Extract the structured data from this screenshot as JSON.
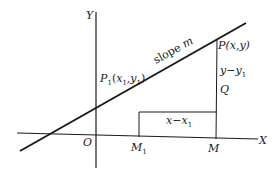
{
  "diagram": {
    "axes": {
      "x_label": "X",
      "y_label": "Y",
      "origin_label": "O"
    },
    "line_label": {
      "text": "slope ",
      "var": "m"
    },
    "points": {
      "p1": {
        "name": "P",
        "sub": "1",
        "open": "(",
        "x": "x",
        "xsub": "1",
        "comma": ",",
        "y": "y",
        "ysub": "1",
        "close": ")"
      },
      "p": {
        "text": "P(x,y)"
      },
      "q": {
        "text": "Q"
      },
      "m1": {
        "name": "M",
        "sub": "1"
      },
      "m": {
        "text": "M"
      }
    },
    "segments": {
      "run": {
        "a": "x",
        "op": "−",
        "b": "x",
        "bsub": "1"
      },
      "rise": {
        "a": "y",
        "op": "−",
        "b": "y",
        "bsub": "1"
      }
    },
    "colors": {
      "ink": "#1a1a1a",
      "background": "#ffffff"
    }
  }
}
